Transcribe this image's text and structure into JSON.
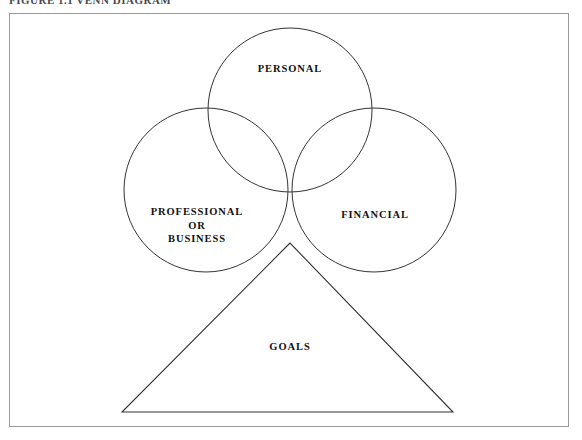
{
  "caption": {
    "text": "FIGURE 1.1  VENN DIAGRAM"
  },
  "diagram": {
    "stroke_color": "#333333",
    "frame_color": "#9a9a9a",
    "background": "#ffffff",
    "circles": [
      {
        "id": "personal",
        "label": "PERSONAL",
        "cx": 290,
        "cy": 110,
        "r": 82,
        "label_x": 290,
        "label_y": 69
      },
      {
        "id": "professional",
        "label": "PROFESSIONAL\nOR\nBUSINESS",
        "cx": 206,
        "cy": 190,
        "r": 82,
        "label_x": 197,
        "label_y": 225
      },
      {
        "id": "financial",
        "label": "FINANCIAL",
        "cx": 374,
        "cy": 190,
        "r": 82,
        "label_x": 375,
        "label_y": 215
      }
    ],
    "triangle": {
      "id": "goals",
      "label": "GOALS",
      "apex_x": 290,
      "apex_y": 243,
      "base_left_x": 122,
      "base_right_x": 453,
      "base_y": 412,
      "label_x": 290,
      "label_y": 347
    }
  }
}
